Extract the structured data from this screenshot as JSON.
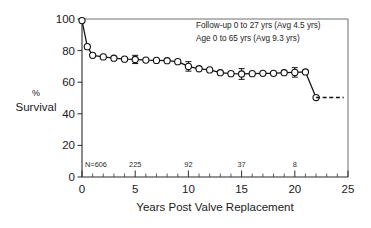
{
  "chart_data": {
    "type": "line",
    "title": "",
    "subtitle": "",
    "xlabel": "Years Post Valve Replacement",
    "ylabel": "% Survival",
    "ylabel_lines": [
      "%",
      "Survival"
    ],
    "xlim": [
      0,
      25
    ],
    "ylim": [
      0,
      100
    ],
    "xticks": [
      0,
      5,
      10,
      15,
      20,
      25
    ],
    "xtick_labels": [
      "0",
      "5",
      "10",
      "15",
      "20",
      "25"
    ],
    "xtick_minor_step": 1,
    "yticks": [
      0,
      20,
      40,
      60,
      80,
      100
    ],
    "ytick_labels": [
      "0",
      "20",
      "40",
      "60",
      "80",
      "100"
    ],
    "grid": false,
    "legend": "none",
    "series": [
      {
        "name": "Survival",
        "marker": "open-circle",
        "x": [
          0.0,
          0.5,
          1.0,
          2.0,
          3.0,
          4.0,
          5.0,
          6.0,
          7.0,
          8.0,
          9.0,
          10.0,
          11.0,
          12.0,
          13.0,
          14.0,
          15.0,
          16.0,
          17.0,
          18.0,
          19.0,
          20.0,
          21.0,
          22.0
        ],
        "y": [
          99.0,
          82.5,
          77.0,
          76.0,
          75.2,
          74.6,
          74.4,
          74.0,
          73.8,
          73.6,
          73.0,
          70.0,
          68.5,
          67.8,
          66.0,
          65.4,
          65.2,
          65.4,
          65.6,
          65.6,
          66.0,
          66.2,
          66.5,
          50.3
        ],
        "errors": [
          {
            "x": 5.0,
            "y": 74.4,
            "err": 2.6
          },
          {
            "x": 10.0,
            "y": 70.0,
            "err": 3.0
          },
          {
            "x": 15.0,
            "y": 65.2,
            "err": 3.4
          },
          {
            "x": 20.0,
            "y": 66.2,
            "err": 3.0
          }
        ]
      },
      {
        "name": "Projected",
        "style": "dashed",
        "marker": "none",
        "x": [
          22.0,
          24.6
        ],
        "y": [
          50.3,
          50.3
        ]
      }
    ],
    "annotations": [
      "Follow-up 0 to 27 yrs (Avg 4.5 yrs)",
      "Age 0 to 65 yrs (Avg 9.3 yrs)"
    ],
    "numbers_at_risk": [
      {
        "x": 0,
        "label": "N=606"
      },
      {
        "x": 5,
        "label": "225"
      },
      {
        "x": 10,
        "label": "92"
      },
      {
        "x": 15,
        "label": "37"
      },
      {
        "x": 20,
        "label": "8"
      }
    ],
    "colors": {
      "line": "#111111",
      "marker_fill": "#ffffff",
      "axis": "#2b2b2b",
      "frame": "#6f6f6f",
      "text": "#1a1a1a"
    }
  }
}
